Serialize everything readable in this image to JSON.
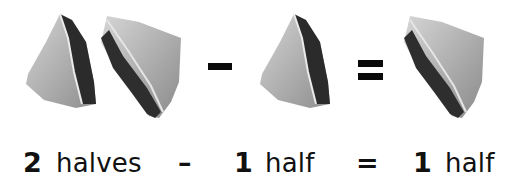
{
  "illustration": {
    "top_row": [
      {
        "type": "sandwich",
        "variant": "left-half",
        "label": "sandwich-half"
      },
      {
        "type": "sandwich",
        "variant": "right-half",
        "label": "sandwich-half"
      },
      {
        "type": "operator",
        "symbol": "-"
      },
      {
        "type": "sandwich",
        "variant": "left-half",
        "label": "sandwich-half"
      },
      {
        "type": "operator",
        "symbol": "="
      },
      {
        "type": "sandwich",
        "variant": "right-half",
        "label": "sandwich-half"
      }
    ]
  },
  "equation": {
    "term1": {
      "number": "2",
      "unit": "halves"
    },
    "op1": "–",
    "term2": {
      "number": "1",
      "unit": "half"
    },
    "op2": "=",
    "term3": {
      "number": "1",
      "unit": "half"
    }
  },
  "colors": {
    "background": "#ffffff",
    "operator": "#0a0a0a",
    "text": "#111111",
    "bread_light": "#c9c9c9",
    "bread_mid": "#9a9a9a",
    "filling_dark": "#2a2a2a"
  }
}
